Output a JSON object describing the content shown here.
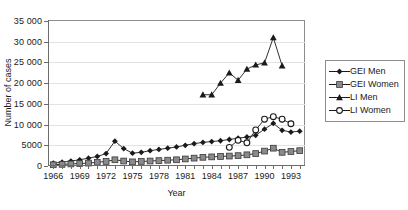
{
  "chart_data": {
    "type": "line",
    "title": "",
    "xlabel": "Year",
    "ylabel": "Number of cases",
    "xlim": [
      1965.4,
      1994.6
    ],
    "ylim": [
      0,
      35000
    ],
    "grid": true,
    "legend_position": "right",
    "ytick_labels": [
      "0",
      "5000",
      "10 000",
      "15 000",
      "20 000",
      "25 000",
      "30 000",
      "35 000"
    ],
    "ytick_values": [
      0,
      5000,
      10000,
      15000,
      20000,
      25000,
      30000,
      35000
    ],
    "xtick_values": [
      1966,
      1967,
      1968,
      1969,
      1970,
      1971,
      1972,
      1973,
      1974,
      1975,
      1976,
      1977,
      1978,
      1979,
      1980,
      1981,
      1982,
      1983,
      1984,
      1985,
      1986,
      1987,
      1988,
      1989,
      1990,
      1991,
      1992,
      1993,
      1994
    ],
    "xtick_labels_shown": [
      1966,
      1969,
      1972,
      1975,
      1978,
      1981,
      1984,
      1987,
      1990,
      1993
    ],
    "series": [
      {
        "name": "GEI Men",
        "marker": "filled-diamond",
        "color": "#1a1a1a",
        "x": [
          1966,
          1967,
          1968,
          1969,
          1970,
          1971,
          1972,
          1973,
          1974,
          1975,
          1976,
          1977,
          1978,
          1979,
          1980,
          1981,
          1982,
          1983,
          1984,
          1985,
          1986,
          1987,
          1988,
          1989,
          1990,
          1991,
          1992,
          1993,
          1994
        ],
        "values": [
          700,
          900,
          1200,
          1500,
          1900,
          2300,
          3000,
          6000,
          4200,
          3100,
          3300,
          3700,
          4000,
          4300,
          4600,
          5000,
          5400,
          5700,
          5900,
          6100,
          6400,
          6700,
          7000,
          7400,
          8900,
          10300,
          8600,
          8200,
          8400
        ]
      },
      {
        "name": "GEI Women",
        "marker": "filled-square",
        "color": "#8a8a8a",
        "x": [
          1966,
          1967,
          1968,
          1969,
          1970,
          1971,
          1972,
          1973,
          1974,
          1975,
          1976,
          1977,
          1978,
          1979,
          1980,
          1981,
          1982,
          1983,
          1984,
          1985,
          1986,
          1987,
          1988,
          1989,
          1990,
          1991,
          1992,
          1993,
          1994
        ],
        "values": [
          300,
          400,
          500,
          600,
          700,
          900,
          1100,
          1500,
          1200,
          1000,
          1100,
          1200,
          1300,
          1400,
          1500,
          1700,
          1900,
          2100,
          2200,
          2300,
          2400,
          2500,
          2700,
          3000,
          3600,
          4300,
          3300,
          3500,
          3700
        ]
      },
      {
        "name": "LI Men",
        "marker": "filled-triangle",
        "color": "#1a1a1a",
        "x": [
          1983,
          1984,
          1985,
          1986,
          1987,
          1988,
          1989,
          1990,
          1991,
          1992
        ],
        "values": [
          17200,
          17200,
          20000,
          22500,
          20700,
          23400,
          24400,
          24900,
          31000,
          24200
        ]
      },
      {
        "name": "LI Women",
        "marker": "open-circle",
        "color": "#1a1a1a",
        "x": [
          1986,
          1987,
          1988,
          1989,
          1990,
          1991,
          1992,
          1993
        ],
        "values": [
          4500,
          6200,
          5600,
          8700,
          11300,
          11900,
          11300,
          10200
        ]
      }
    ]
  },
  "legend": {
    "items": [
      {
        "label": "GEI Men"
      },
      {
        "label": "GEI Women"
      },
      {
        "label": "LI Men"
      },
      {
        "label": "LI Women"
      }
    ]
  }
}
